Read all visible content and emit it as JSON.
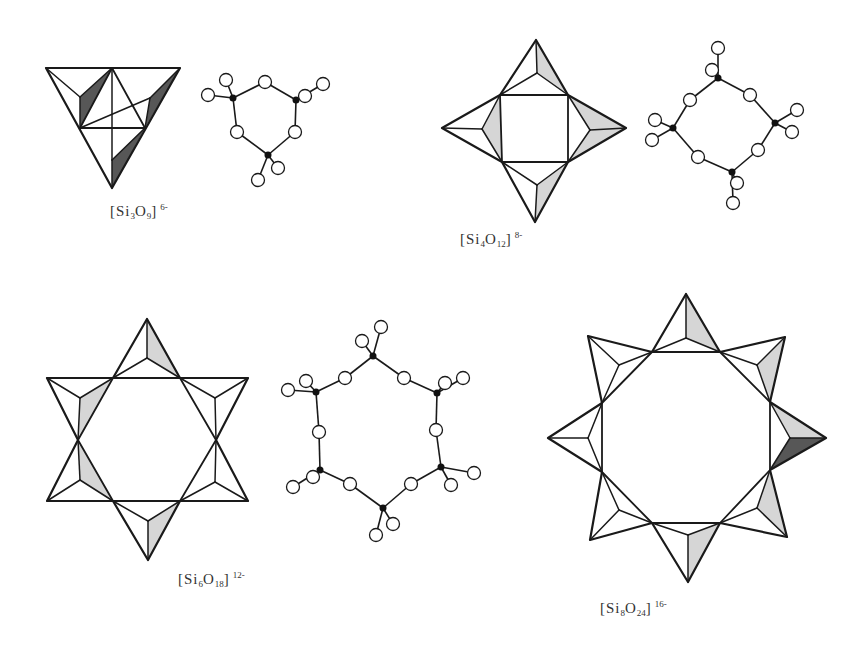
{
  "figure": {
    "panels": [
      {
        "id": "si3o9",
        "label": {
          "prefix": "[Si",
          "si_count": "3",
          "mid": "O",
          "o_count": "9",
          "close": "]",
          "charge": "6-",
          "x": 146,
          "y": 200
        },
        "polyhedral": {
          "outline": [
            [
              46,
              68
            ],
            [
              180,
              68
            ],
            [
              112,
              188
            ]
          ],
          "inner": [
            [
              112,
              68
            ],
            [
              80,
              128
            ],
            [
              145,
              128
            ]
          ],
          "apexes": [
            [
              80,
              97
            ],
            [
              150,
              98
            ],
            [
              112,
              160
            ]
          ],
          "shaded_dark": [
            [
              [
                112,
                68
              ],
              [
                80,
                128
              ],
              [
                80,
                97
              ]
            ],
            [
              [
                180,
                68
              ],
              [
                145,
                128
              ],
              [
                150,
                98
              ]
            ],
            [
              [
                145,
                128
              ],
              [
                112,
                188
              ],
              [
                112,
                160
              ]
            ]
          ],
          "shaded_light": []
        },
        "ball_stick": {
          "si": [
            [
              233,
              98
            ],
            [
              296,
              100
            ],
            [
              268,
              155
            ]
          ],
          "ring_o": [
            [
              265,
              82
            ],
            [
              295,
              132
            ],
            [
              237,
              132
            ]
          ],
          "terminal_o": [
            [
              208,
              95
            ],
            [
              226,
              80
            ],
            [
              305,
              96
            ],
            [
              323,
              84
            ],
            [
              258,
              180
            ],
            [
              278,
              168
            ]
          ],
          "terminal_parent": [
            0,
            0,
            1,
            1,
            2,
            2
          ]
        }
      },
      {
        "id": "si4o12",
        "label": {
          "prefix": "[Si",
          "si_count": "4",
          "mid": "O",
          "o_count": "12",
          "close": "]",
          "charge": "8-",
          "x": 496,
          "y": 228
        },
        "polyhedral": {
          "outline": [
            [
              536,
              40
            ],
            [
              568,
              95
            ],
            [
              626,
              128
            ],
            [
              568,
              162
            ],
            [
              535,
              222
            ],
            [
              502,
              162
            ],
            [
              442,
              128
            ],
            [
              500,
              95
            ]
          ],
          "inner": [
            [
              500,
              95
            ],
            [
              568,
              95
            ],
            [
              568,
              162
            ],
            [
              502,
              162
            ]
          ],
          "apexes": [
            [
              537,
              73
            ],
            [
              590,
              130
            ],
            [
              537,
              185
            ],
            [
              482,
              129
            ]
          ],
          "shaded_dark": [],
          "shaded_light": [
            [
              [
                536,
                40
              ],
              [
                568,
                95
              ],
              [
                537,
                73
              ]
            ],
            [
              [
                568,
                95
              ],
              [
                626,
                128
              ],
              [
                590,
                130
              ]
            ],
            [
              [
                568,
                162
              ],
              [
                626,
                128
              ],
              [
                590,
                130
              ]
            ],
            [
              [
                568,
                162
              ],
              [
                535,
                222
              ],
              [
                537,
                185
              ]
            ],
            [
              [
                502,
                162
              ],
              [
                500,
                95
              ],
              [
                482,
                129
              ]
            ]
          ]
        },
        "ball_stick": {
          "si": [
            [
              718,
              78
            ],
            [
              775,
              123
            ],
            [
              732,
              172
            ],
            [
              673,
              128
            ]
          ],
          "ring_o": [
            [
              750,
              95
            ],
            [
              758,
              150
            ],
            [
              698,
              157
            ],
            [
              690,
              100
            ]
          ],
          "terminal_o": [
            [
              718,
              48
            ],
            [
              712,
              70
            ],
            [
              797,
              110
            ],
            [
              792,
              132
            ],
            [
              737,
              183
            ],
            [
              733,
              203
            ],
            [
              655,
              120
            ],
            [
              652,
              140
            ]
          ],
          "terminal_parent": [
            0,
            0,
            1,
            1,
            2,
            2,
            3,
            3
          ]
        }
      },
      {
        "id": "si6o18",
        "label": {
          "prefix": "[Si",
          "si_count": "6",
          "mid": "O",
          "o_count": "18",
          "close": "]",
          "charge": "12-",
          "x": 214,
          "y": 568
        },
        "polyhedral": {
          "outline": [
            [
              147,
              319
            ],
            [
              180,
              378
            ],
            [
              248,
              378
            ],
            [
              216,
              440
            ],
            [
              248,
              501
            ],
            [
              180,
              501
            ],
            [
              148,
              560
            ],
            [
              113,
              501
            ],
            [
              47,
              501
            ],
            [
              78,
              440
            ],
            [
              47,
              378
            ],
            [
              113,
              378
            ]
          ],
          "inner": [
            [
              113,
              378
            ],
            [
              180,
              378
            ],
            [
              216,
              440
            ],
            [
              180,
              501
            ],
            [
              113,
              501
            ],
            [
              78,
              440
            ]
          ],
          "apexes": [
            [
              147,
              358
            ],
            [
              215,
              398
            ],
            [
              215,
              482
            ],
            [
              148,
              521
            ],
            [
              80,
              480
            ],
            [
              80,
              398
            ]
          ],
          "shaded_dark": [],
          "shaded_light": [
            [
              [
                147,
                319
              ],
              [
                180,
                378
              ],
              [
                147,
                358
              ]
            ],
            [
              [
                113,
                378
              ],
              [
                78,
                440
              ],
              [
                80,
                398
              ]
            ],
            [
              [
                78,
                440
              ],
              [
                113,
                501
              ],
              [
                80,
                480
              ]
            ],
            [
              [
                180,
                501
              ],
              [
                148,
                560
              ],
              [
                148,
                521
              ]
            ]
          ]
        },
        "ball_stick": {
          "si": [
            [
              373,
              356
            ],
            [
              437,
              393
            ],
            [
              441,
              467
            ],
            [
              383,
              508
            ],
            [
              320,
              470
            ],
            [
              316,
              392
            ]
          ],
          "ring_o": [
            [
              404,
              378
            ],
            [
              436,
              430
            ],
            [
              411,
              484
            ],
            [
              350,
              484
            ],
            [
              319,
              432
            ],
            [
              345,
              378
            ]
          ],
          "terminal_o": [
            [
              362,
              341
            ],
            [
              381,
              327
            ],
            [
              445,
              383
            ],
            [
              463,
              378
            ],
            [
              451,
              485
            ],
            [
              474,
              473
            ],
            [
              376,
              535
            ],
            [
              393,
              524
            ],
            [
              313,
              477
            ],
            [
              293,
              487
            ],
            [
              306,
              381
            ],
            [
              288,
              390
            ]
          ],
          "terminal_parent": [
            0,
            0,
            1,
            1,
            2,
            2,
            3,
            3,
            4,
            4,
            5,
            5
          ]
        }
      },
      {
        "id": "si8o24",
        "label": {
          "prefix": "[Si",
          "si_count": "8",
          "mid": "O",
          "o_count": "24",
          "close": "]",
          "charge": "16-",
          "x": 636,
          "y": 597
        },
        "polyhedral": {
          "outline": [
            [
              686,
              294
            ],
            [
              720,
              352
            ],
            [
              785,
              337
            ],
            [
              770,
              402
            ],
            [
              826,
              438
            ],
            [
              770,
              470
            ],
            [
              787,
              537
            ],
            [
              720,
              523
            ],
            [
              688,
              582
            ],
            [
              652,
              523
            ],
            [
              590,
              540
            ],
            [
              602,
              472
            ],
            [
              548,
              438
            ],
            [
              602,
              403
            ],
            [
              588,
              336
            ],
            [
              652,
              352
            ]
          ],
          "inner": [
            [
              652,
              352
            ],
            [
              720,
              352
            ],
            [
              770,
              402
            ],
            [
              770,
              470
            ],
            [
              720,
              523
            ],
            [
              652,
              523
            ],
            [
              602,
              472
            ],
            [
              602,
              403
            ]
          ],
          "apexes": [
            [
              686,
              338
            ],
            [
              757,
              365
            ],
            [
              790,
              438
            ],
            [
              757,
              508
            ],
            [
              688,
              535
            ],
            [
              619,
              510
            ],
            [
              588,
              438
            ],
            [
              619,
              365
            ]
          ],
          "shaded_dark": [
            [
              [
                770,
                470
              ],
              [
                826,
                438
              ],
              [
                790,
                438
              ]
            ]
          ],
          "shaded_light": [
            [
              [
                686,
                294
              ],
              [
                720,
                352
              ],
              [
                686,
                338
              ]
            ],
            [
              [
                785,
                337
              ],
              [
                770,
                402
              ],
              [
                757,
                365
              ]
            ],
            [
              [
                770,
                402
              ],
              [
                826,
                438
              ],
              [
                790,
                438
              ]
            ],
            [
              [
                787,
                537
              ],
              [
                770,
                470
              ],
              [
                757,
                508
              ]
            ],
            [
              [
                688,
                582
              ],
              [
                720,
                523
              ],
              [
                688,
                535
              ]
            ]
          ]
        }
      }
    ]
  }
}
